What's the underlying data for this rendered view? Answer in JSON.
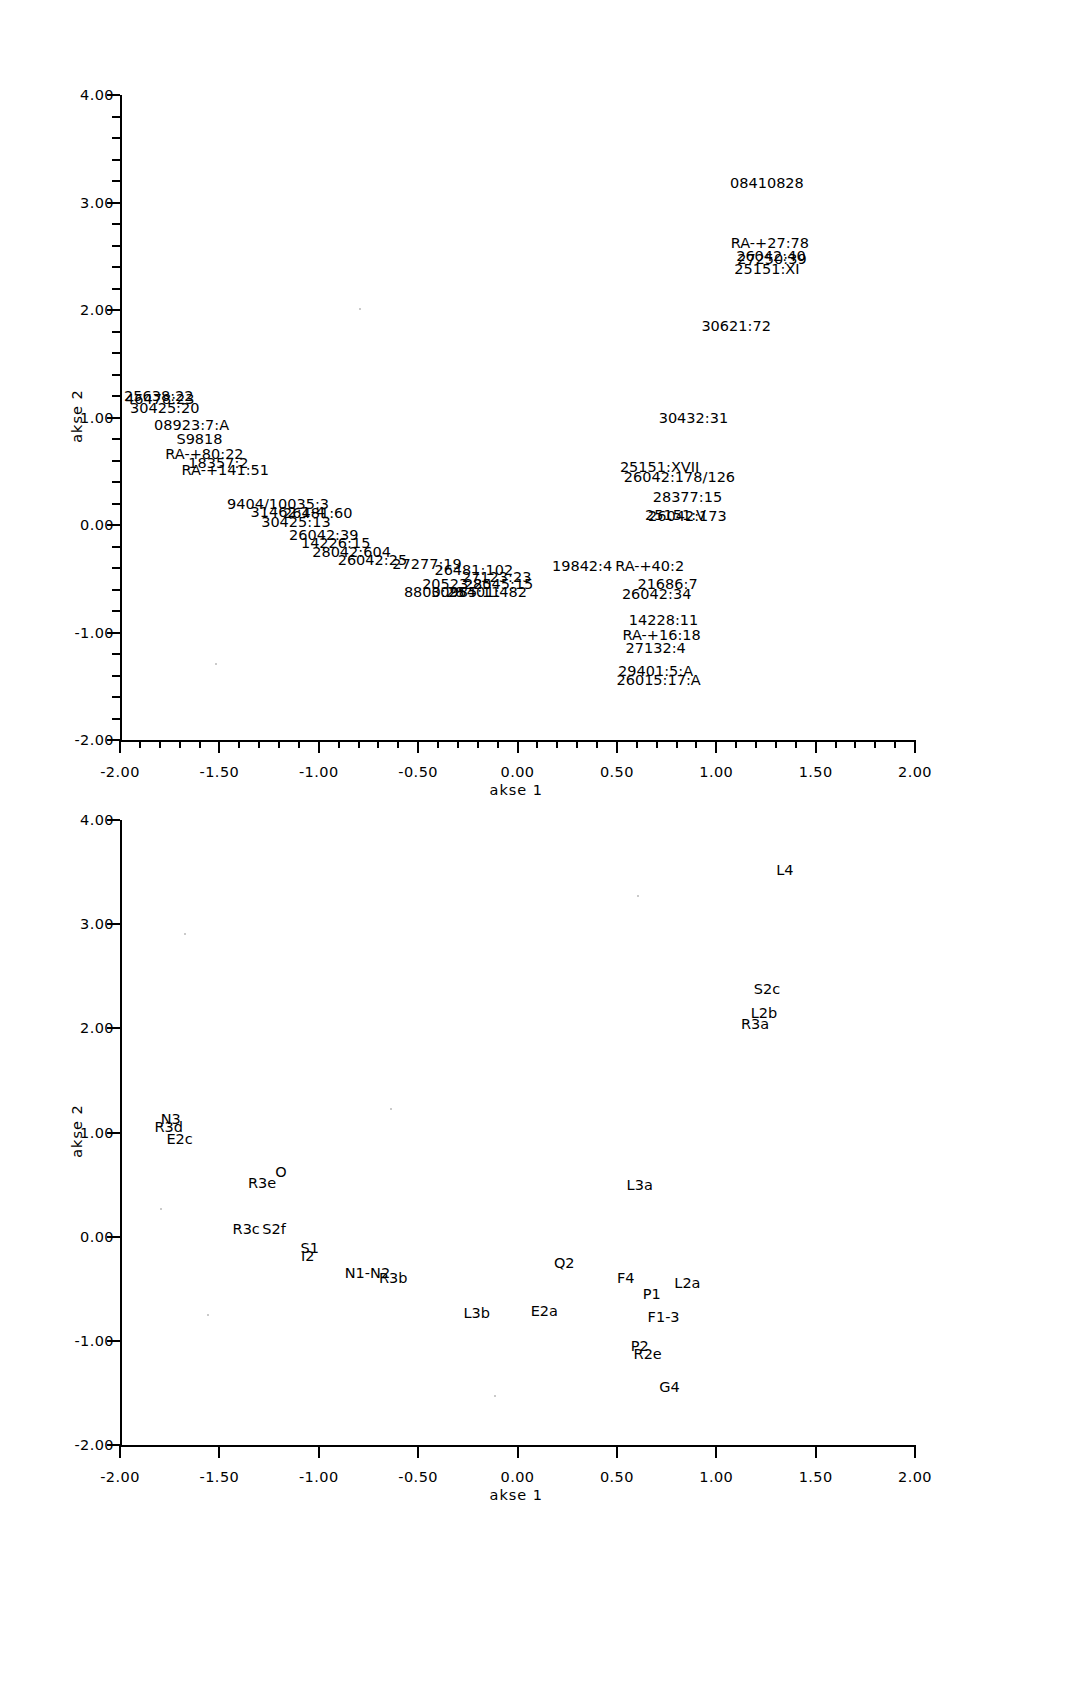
{
  "figure": {
    "background": "#ffffff",
    "ink": "#000000"
  },
  "chart_data": [
    {
      "type": "scatter",
      "title": "",
      "xlabel": "akse 1",
      "ylabel": "akse 2",
      "xlim": [
        -2.0,
        2.0
      ],
      "ylim": [
        -2.0,
        4.0
      ],
      "xticks": [
        "-2.00",
        "-1.50",
        "-1.00",
        "-0.50",
        "0.00",
        "0.50",
        "1.00",
        "1.50",
        "2.00"
      ],
      "yticks": [
        "4.00",
        "3.00",
        "2.00",
        "1.00",
        "0.00",
        "-1.00",
        "-2.00"
      ],
      "minor_ticks": true,
      "grid": false,
      "legend": "none",
      "labels_are_points": true,
      "points": [
        {
          "label": "08410828",
          "x": 1.255,
          "y": 3.18
        },
        {
          "label": "RA-+27:78",
          "x": 1.27,
          "y": 2.62
        },
        {
          "label": "26042:40",
          "x": 1.275,
          "y": 2.5
        },
        {
          "label": "27250:39",
          "x": 1.28,
          "y": 2.47
        },
        {
          "label": "25151:XI",
          "x": 1.255,
          "y": 2.38
        },
        {
          "label": "30621:72",
          "x": 1.1,
          "y": 1.85
        },
        {
          "label": "25638:22",
          "x": -1.805,
          "y": 1.2
        },
        {
          "label": "46478:23",
          "x": -1.8,
          "y": 1.17
        },
        {
          "label": "30425:20",
          "x": -1.775,
          "y": 1.09
        },
        {
          "label": "30432:31",
          "x": 0.885,
          "y": 1.0
        },
        {
          "label": "08923:7:A",
          "x": -1.64,
          "y": 0.93
        },
        {
          "label": "S9818",
          "x": -1.6,
          "y": 0.8
        },
        {
          "label": "RA-+80:22",
          "x": -1.575,
          "y": 0.66
        },
        {
          "label": "18357:2",
          "x": -1.505,
          "y": 0.58
        },
        {
          "label": "25151:XVII",
          "x": 0.715,
          "y": 0.54
        },
        {
          "label": "RA-+141:51",
          "x": -1.47,
          "y": 0.51
        },
        {
          "label": "26042:178/126",
          "x": 0.815,
          "y": 0.45
        },
        {
          "label": "28377:15",
          "x": 0.855,
          "y": 0.26
        },
        {
          "label": "9404/10035:3",
          "x": -1.205,
          "y": 0.2
        },
        {
          "label": "31462:1-4",
          "x": -1.155,
          "y": 0.12
        },
        {
          "label": "26481:60",
          "x": -1.005,
          "y": 0.11
        },
        {
          "label": "25151:V",
          "x": 0.795,
          "y": 0.09
        },
        {
          "label": "26042:173",
          "x": 0.855,
          "y": 0.08
        },
        {
          "label": "30425:13",
          "x": -1.115,
          "y": 0.03
        },
        {
          "label": "26042:39",
          "x": -0.975,
          "y": -0.09
        },
        {
          "label": "14226:15",
          "x": -0.915,
          "y": -0.17
        },
        {
          "label": "28042:604",
          "x": -0.835,
          "y": -0.25
        },
        {
          "label": "26042:25",
          "x": -0.73,
          "y": -0.33
        },
        {
          "label": "27277:19",
          "x": -0.455,
          "y": -0.36
        },
        {
          "label": "26481:102",
          "x": -0.22,
          "y": -0.42
        },
        {
          "label": "19842:4",
          "x": 0.325,
          "y": -0.38
        },
        {
          "label": "RA-+40:2",
          "x": 0.665,
          "y": -0.38
        },
        {
          "label": "27123:23",
          "x": -0.105,
          "y": -0.48
        },
        {
          "label": "20523:25",
          "x": -0.305,
          "y": -0.55
        },
        {
          "label": "28045:15",
          "x": -0.095,
          "y": -0.55
        },
        {
          "label": "21686:7",
          "x": 0.755,
          "y": -0.55
        },
        {
          "label": "8800:28",
          "x": -0.42,
          "y": -0.62
        },
        {
          "label": "30985:11",
          "x": -0.26,
          "y": -0.62
        },
        {
          "label": "25401:482",
          "x": -0.15,
          "y": -0.62
        },
        {
          "label": "26042:34",
          "x": 0.7,
          "y": -0.64
        },
        {
          "label": "14228:11",
          "x": 0.735,
          "y": -0.88
        },
        {
          "label": "RA-+16:18",
          "x": 0.725,
          "y": -1.02
        },
        {
          "label": "27132:4",
          "x": 0.695,
          "y": -1.14
        },
        {
          "label": "29401:5:A",
          "x": 0.695,
          "y": -1.36
        },
        {
          "label": "26015:17:A",
          "x": 0.71,
          "y": -1.44
        }
      ]
    },
    {
      "type": "scatter",
      "title": "",
      "xlabel": "akse 1",
      "ylabel": "akse 2",
      "xlim": [
        -2.0,
        2.0
      ],
      "ylim": [
        -2.0,
        4.0
      ],
      "xticks": [
        "-2.00",
        "-1.50",
        "-1.00",
        "-0.50",
        "0.00",
        "0.50",
        "1.00",
        "1.50",
        "2.00"
      ],
      "yticks": [
        "4.00",
        "3.00",
        "2.00",
        "1.00",
        "0.00",
        "-1.00",
        "-2.00"
      ],
      "minor_ticks": false,
      "grid": false,
      "legend": "none",
      "labels_are_points": true,
      "points": [
        {
          "label": "L4",
          "x": 1.345,
          "y": 3.52
        },
        {
          "label": "S2c",
          "x": 1.255,
          "y": 2.38
        },
        {
          "label": "L2b",
          "x": 1.24,
          "y": 2.15
        },
        {
          "label": "R3a",
          "x": 1.195,
          "y": 2.04
        },
        {
          "label": "N3",
          "x": -1.745,
          "y": 1.13
        },
        {
          "label": "R3d",
          "x": -1.755,
          "y": 1.05
        },
        {
          "label": "E2c",
          "x": -1.7,
          "y": 0.94
        },
        {
          "label": "O",
          "x": -1.19,
          "y": 0.62
        },
        {
          "label": "R3e",
          "x": -1.285,
          "y": 0.52
        },
        {
          "label": "L3a",
          "x": 0.615,
          "y": 0.5
        },
        {
          "label": "R3c",
          "x": -1.365,
          "y": 0.07
        },
        {
          "label": "S2f",
          "x": -1.225,
          "y": 0.07
        },
        {
          "label": "S1",
          "x": -1.045,
          "y": -0.11
        },
        {
          "label": "I2",
          "x": -1.055,
          "y": -0.19
        },
        {
          "label": "Q2",
          "x": 0.235,
          "y": -0.25
        },
        {
          "label": "N1-N2",
          "x": -0.755,
          "y": -0.35
        },
        {
          "label": "R3b",
          "x": -0.625,
          "y": -0.4
        },
        {
          "label": "F4",
          "x": 0.545,
          "y": -0.4
        },
        {
          "label": "L2a",
          "x": 0.855,
          "y": -0.44
        },
        {
          "label": "P1",
          "x": 0.675,
          "y": -0.55
        },
        {
          "label": "E2a",
          "x": 0.135,
          "y": -0.71
        },
        {
          "label": "L3b",
          "x": -0.205,
          "y": -0.73
        },
        {
          "label": "F1-3",
          "x": 0.735,
          "y": -0.77
        },
        {
          "label": "P2",
          "x": 0.615,
          "y": -1.05
        },
        {
          "label": "R2e",
          "x": 0.655,
          "y": -1.13
        },
        {
          "label": "G4",
          "x": 0.765,
          "y": -1.44
        }
      ]
    }
  ]
}
